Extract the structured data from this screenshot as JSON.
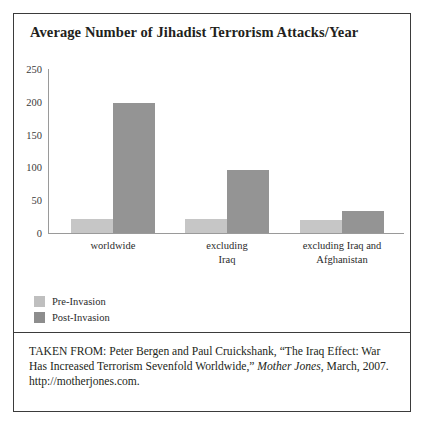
{
  "figure": {
    "title": "Average Number of Jihadist Terrorism Attacks/Year",
    "border_color": "#3b3b3b",
    "background": "#ffffff"
  },
  "chart_data": {
    "type": "bar",
    "title": "Average Number of Jihadist Terrorism Attacks/Year",
    "xlabel": "",
    "ylabel": "",
    "ylim": [
      0,
      250
    ],
    "yticks": [
      0,
      50,
      100,
      150,
      200,
      250
    ],
    "ytick_labels": [
      "0",
      "50",
      "100",
      "150",
      "200",
      "250"
    ],
    "grid": false,
    "legend_position": "below-plot-left",
    "categories": [
      "worldwide",
      "excluding Iraq",
      "excluding Iraq and Afghanistan"
    ],
    "category_label_lines": [
      [
        "worldwide"
      ],
      [
        "excluding",
        "Iraq"
      ],
      [
        "excluding Iraq and",
        "Afghanistan"
      ]
    ],
    "series": [
      {
        "name": "Pre-Invasion",
        "color": "#c6c6c6",
        "values": [
          22,
          22,
          20
        ]
      },
      {
        "name": "Post-Invasion",
        "color": "#949494",
        "values": [
          198,
          96,
          33
        ]
      }
    ]
  },
  "legend": {
    "items": [
      {
        "label": "Pre-Invasion",
        "color": "#bfbfbf"
      },
      {
        "label": "Post-Invasion",
        "color": "#8d8d8d"
      }
    ]
  },
  "source": {
    "line1_prefix": "TAKEN FROM: Peter Bergen and Paul Cruickshank, “The Iraq Effect:",
    "line2_prefix": "War Has Increased Terrorism Sevenfold Worldwide,” ",
    "line2_italic": "Mother Jones",
    "line2_suffix": ",",
    "line3": "March, 2007. http://motherjones.com."
  }
}
